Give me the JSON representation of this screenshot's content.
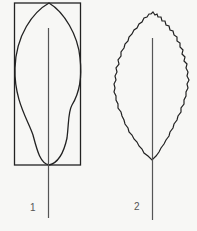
{
  "figure": {
    "colors": {
      "background": "#f7f7f5",
      "stroke": "#222222",
      "midrib": "#555555",
      "label": "#555555"
    },
    "leaves": [
      {
        "label": "1",
        "shape": "obovate-elongate leaf with smooth (entire) margin inside bounding rectangle",
        "has_bounding_box": true,
        "margin": "entire"
      },
      {
        "label": "2",
        "shape": "elliptic leaf with serrated margin",
        "has_bounding_box": false,
        "margin": "serrate"
      }
    ]
  }
}
